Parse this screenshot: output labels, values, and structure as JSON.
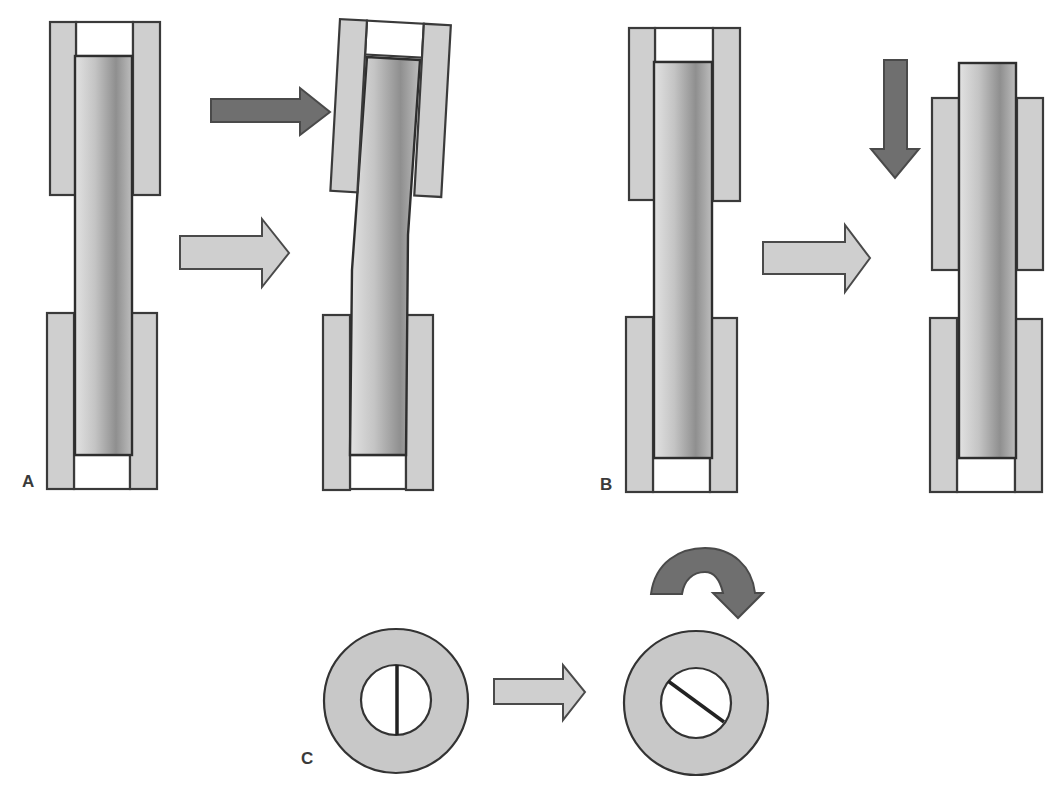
{
  "figure": {
    "type": "schematic diagram of rod in two cylindrical holders under load",
    "panels": [
      {
        "label": "A",
        "description": "Lateral (shear/bending) load: upper holder displaced sideways, rod bends",
        "force_arrow": "horizontal dark arrow pushing top holder right",
        "transition_arrow": "light right arrow"
      },
      {
        "label": "B",
        "description": "Axial load: rod pushed/pulled along its axis, upper holder shifted",
        "force_arrow": "vertical dark arrow pointing down",
        "transition_arrow": "light right arrow"
      },
      {
        "label": "C",
        "description": "Torsional load: cross-section rotates, fracture line turns from vertical to diagonal",
        "force_arrow": "curved dark clockwise arrow",
        "transition_arrow": "light right arrow"
      }
    ]
  },
  "labels": {
    "a": "A",
    "b": "B",
    "c": "C"
  },
  "colors": {
    "plate_fill": "#cfcfcf",
    "outline": "#3a3a3a",
    "dark_arrow": "#6f6f6f",
    "light_arrow": "#cfcfcf",
    "rod_light": "#e6e6e6",
    "rod_dark": "#8e8e8e"
  }
}
